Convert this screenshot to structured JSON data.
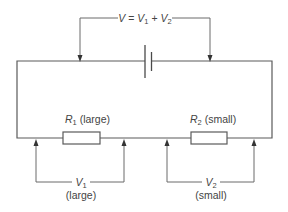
{
  "diagram": {
    "total_voltage": {
      "symbol": "V",
      "equals": " = ",
      "term1_symbol": "V",
      "term1_sub": "1",
      "plus": " + ",
      "term2_symbol": "V",
      "term2_sub": "2"
    },
    "components": {
      "battery": {
        "label": "battery"
      },
      "r1": {
        "symbol": "R",
        "sub": "1",
        "note": " (large)"
      },
      "r2": {
        "symbol": "R",
        "sub": "2",
        "note": " (small)"
      }
    },
    "measurements": {
      "v1": {
        "symbol": "V",
        "sub": "1",
        "note": "(large)"
      },
      "v2": {
        "symbol": "V",
        "sub": "2",
        "note": "(small)"
      }
    }
  }
}
